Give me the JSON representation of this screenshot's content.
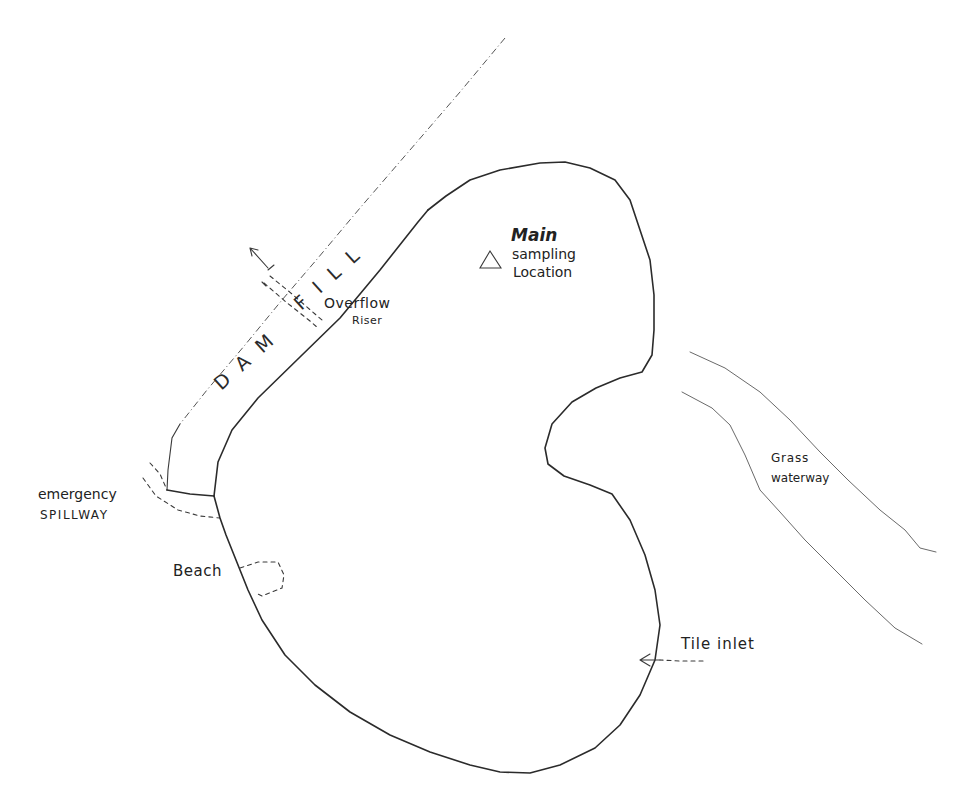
{
  "map": {
    "type": "hand-drawn pond site sketch",
    "features": {
      "pond": {
        "name": "pond-outline"
      },
      "dam": {
        "label_left": "DAM",
        "label_right": "FILL"
      },
      "sampling": {
        "title": "Main",
        "line1": "sampling",
        "line2": "Location",
        "marker": "triangle-icon"
      },
      "overflow": {
        "line1": "Overflow",
        "line2": "Riser"
      },
      "spillway": {
        "line1": "emergency",
        "line2": "SPILLWAY"
      },
      "beach": {
        "label": "Beach"
      },
      "grass_waterway": {
        "line1": "Grass",
        "line2": "waterway"
      },
      "tile_inlet": {
        "label": "Tile inlet"
      }
    },
    "colors": {
      "ink": "#2b2b2b",
      "paper": "#ffffff"
    }
  }
}
